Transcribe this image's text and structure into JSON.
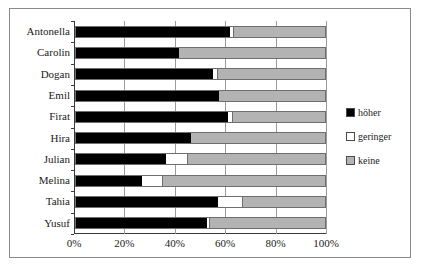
{
  "chart_data": {
    "type": "bar",
    "subtype": "stacked-horizontal-100pct",
    "title": "",
    "xlabel": "",
    "ylabel": "",
    "xlim": [
      0,
      100
    ],
    "xticks": [
      "0%",
      "20%",
      "40%",
      "60%",
      "80%",
      "100%"
    ],
    "xtick_values": [
      0,
      20,
      40,
      60,
      80,
      100
    ],
    "grid": true,
    "legend_position": "right",
    "categories": [
      "Antonella",
      "Carolin",
      "Dogan",
      "Emil",
      "Firat",
      "Hira",
      "Julian",
      "Melina",
      "Tahia",
      "Yusuf"
    ],
    "series": [
      {
        "name": "höher",
        "color": "#000000",
        "values": [
          62,
          41.5,
          55,
          57.5,
          61,
          46,
          36,
          26.5,
          57,
          52.5
        ]
      },
      {
        "name": "geringer",
        "color": "#ffffff",
        "values": [
          1.5,
          0,
          2,
          0,
          2,
          0,
          9,
          8.5,
          10,
          1.5
        ]
      },
      {
        "name": "keine",
        "color": "#b3b3b3",
        "values": [
          36.5,
          58.5,
          43,
          42.5,
          37,
          54,
          55,
          65,
          33,
          46
        ]
      }
    ]
  },
  "legend": {
    "items": [
      {
        "label": "höher",
        "swatch": "black-square"
      },
      {
        "label": "geringer",
        "swatch": "white-square"
      },
      {
        "label": "keine",
        "swatch": "gray-square"
      }
    ]
  },
  "colors": {
    "hoeher": "#000000",
    "geringer": "#ffffff",
    "keine": "#b3b3b3",
    "axis": "#3a3a3a",
    "grid": "#9a9a9a",
    "border": "#8a8a8a"
  }
}
